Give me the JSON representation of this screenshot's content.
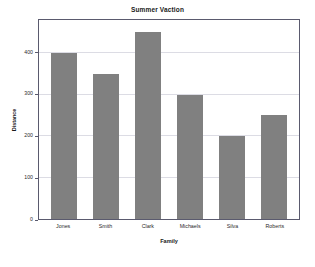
{
  "chart_data": {
    "type": "bar",
    "title": "Summer Vaction",
    "xlabel": "Family",
    "ylabel": "Distance",
    "categories": [
      "Jones",
      "Smith",
      "Clark",
      "Michaels",
      "Silva",
      "Roberts"
    ],
    "values": [
      400,
      350,
      450,
      300,
      200,
      250
    ],
    "ylim": [
      0,
      480
    ],
    "yticks": [
      0,
      100,
      200,
      300,
      400
    ],
    "ytick_labels": [
      "0",
      "100",
      "200",
      "300",
      "400"
    ],
    "grid": "horizontal",
    "legend": "none",
    "bar_color": "#808080",
    "plot_background": "#ffffff",
    "frame_color": "#5a5a6e",
    "gridline_color": "#dcdce4",
    "figure_background": "#ffffff"
  }
}
